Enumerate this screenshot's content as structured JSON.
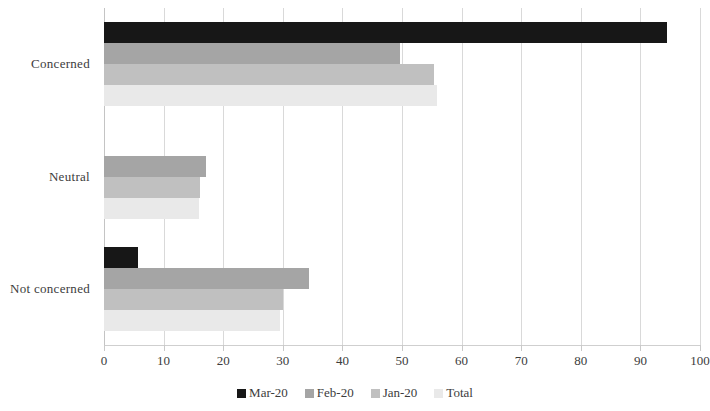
{
  "chart_data": {
    "type": "bar",
    "orientation": "horizontal",
    "title": "",
    "subtitle": "",
    "xlabel": "",
    "ylabel": "",
    "categories": [
      "Concerned",
      "Neutral",
      "Not concerned"
    ],
    "series": [
      {
        "name": "Mar-20",
        "color": "#171717",
        "values": [
          94.5,
          0,
          5.7
        ]
      },
      {
        "name": "Feb-20",
        "color": "#a5a5a5",
        "values": [
          49.7,
          17.1,
          34.4
        ]
      },
      {
        "name": "Jan-20",
        "color": "#c0c0c0",
        "values": [
          55.4,
          16.1,
          30.0
        ]
      },
      {
        "name": "Total",
        "color": "#e9e9e9",
        "values": [
          55.9,
          16.0,
          29.5
        ]
      }
    ],
    "xlim": [
      0,
      100
    ],
    "xticks": [
      0,
      10,
      20,
      30,
      40,
      50,
      60,
      70,
      80,
      90,
      100
    ],
    "xtick_labels": [
      "0",
      "10",
      "20",
      "30",
      "40",
      "50",
      "60",
      "70",
      "80",
      "90",
      "100"
    ],
    "grid": true,
    "grid_axis": "x",
    "legend": {
      "position": "bottom",
      "entries": [
        "Mar-20",
        "Feb-20",
        "Jan-20",
        "Total"
      ]
    }
  }
}
